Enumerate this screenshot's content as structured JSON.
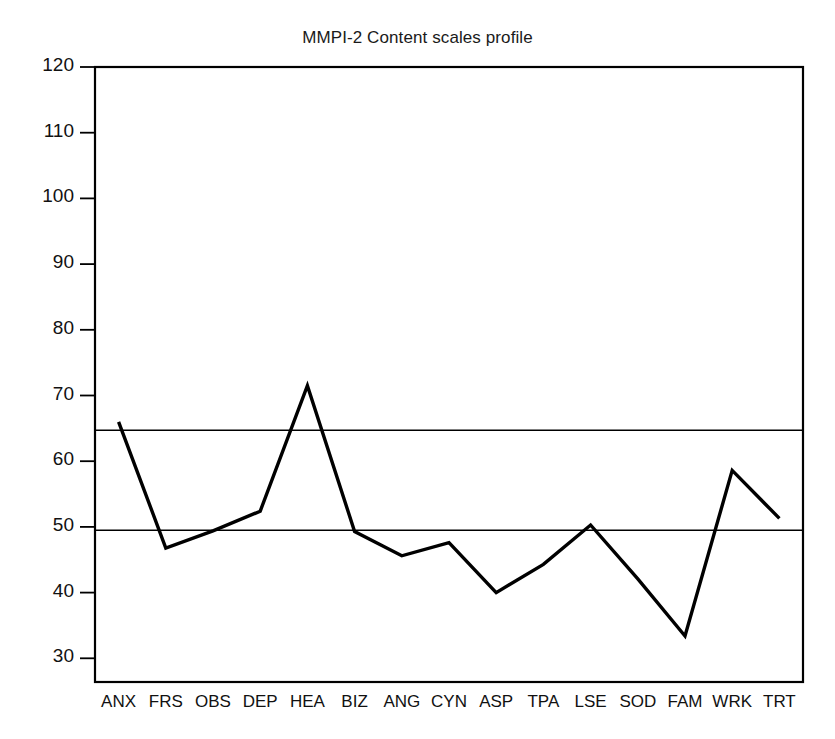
{
  "chart_data": {
    "type": "line",
    "title": "MMPI-2 Content scales profile",
    "xlabel": "",
    "ylabel": "",
    "categories": [
      "ANX",
      "FRS",
      "OBS",
      "DEP",
      "HEA",
      "BIZ",
      "ANG",
      "CYN",
      "ASP",
      "TPA",
      "LSE",
      "SOD",
      "FAM",
      "WRK",
      "TRT"
    ],
    "series": [
      {
        "name": "T score",
        "values": [
          66,
          46.8,
          49.4,
          52.4,
          71.5,
          49.3,
          45.6,
          47.6,
          40,
          44.3,
          50.3,
          42.1,
          33.4,
          58.6,
          51.3
        ]
      }
    ],
    "ylim": [
      26.4,
      120
    ],
    "yticks": [
      30,
      40,
      50,
      60,
      70,
      80,
      90,
      100,
      110,
      120
    ],
    "ytick_labels": [
      "30",
      "40",
      "50",
      "60",
      "70",
      "80",
      "90",
      "100",
      "110",
      "120"
    ],
    "reference_lines": [
      {
        "name": "upper-clinical-cutoff",
        "value": 64.7
      },
      {
        "name": "lower-mean-line",
        "value": 49.5
      }
    ],
    "grid": false,
    "legend": "none",
    "line_color": "#000000",
    "axis_color": "#000000",
    "background_color": "#ffffff"
  }
}
